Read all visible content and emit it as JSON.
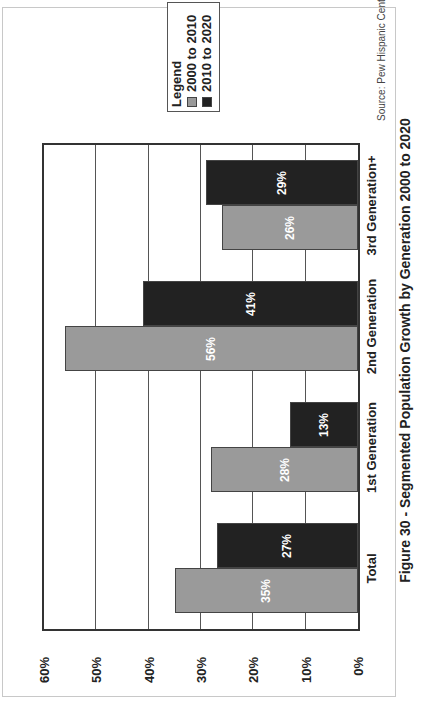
{
  "chart_data": {
    "type": "bar",
    "title": "Figure 30 - Segmented Population Growth by Generation 2000 to 2020",
    "source": "Source: Pew Hispanic Center",
    "xlabel": "",
    "ylabel": "",
    "categories": [
      "Total",
      "1st Generation",
      "2nd Generation",
      "3rd Generation+"
    ],
    "series": [
      {
        "name": "2000 to 2010",
        "color": "#9a9a9a",
        "values": [
          35,
          28,
          56,
          26
        ],
        "labels": [
          "35%",
          "28%",
          "56%",
          "26%"
        ]
      },
      {
        "name": "2010 to 2020",
        "color": "#222222",
        "values": [
          27,
          13,
          41,
          29
        ],
        "labels": [
          "27%",
          "13%",
          "41%",
          "29%"
        ]
      }
    ],
    "ylim": [
      0,
      60
    ],
    "yticks": [
      "0%",
      "10%",
      "20%",
      "30%",
      "40%",
      "50%",
      "60%"
    ],
    "grid": true,
    "legend": {
      "title": "Legend",
      "position": "upper right"
    },
    "orientation_note": "image rotated 90 degrees counter-clockwise"
  }
}
